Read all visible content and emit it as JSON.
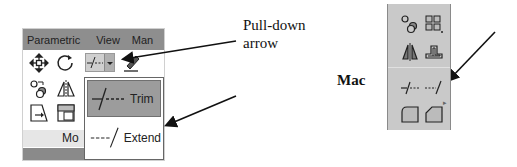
{
  "ribbon": {
    "tabs": [
      "Parametric",
      "View",
      "Man"
    ],
    "panel_label": "Mo",
    "tools_row1": [
      "move-icon",
      "rotate-icon",
      "trim-split-button",
      "pencil-icon"
    ],
    "tools_row2": [
      "copy-icon",
      "mirror-icon"
    ],
    "tools_row3": [
      "scale-icon",
      "array-icon"
    ]
  },
  "dropdown": {
    "items": [
      {
        "label": "Trim",
        "glyph": "-/---",
        "selected": true
      },
      {
        "label": "Extend",
        "glyph": "---/",
        "selected": false
      }
    ]
  },
  "annotations": {
    "pulldown_line1": "Pull-down",
    "pulldown_line2": "arrow",
    "mac_label": "Mac"
  },
  "mac_panel": {
    "icons": [
      "copy-icon",
      "rectangular-array-icon",
      "mirror-icon",
      "offset-icon",
      "trim-icon",
      "extend-icon",
      "fillet-icon",
      "chamfer-icon"
    ]
  },
  "colors": {
    "tabbar": "#8e8e8e",
    "menu_selected": "#9c9c9c",
    "mac_panel": "#c9c9c9"
  }
}
